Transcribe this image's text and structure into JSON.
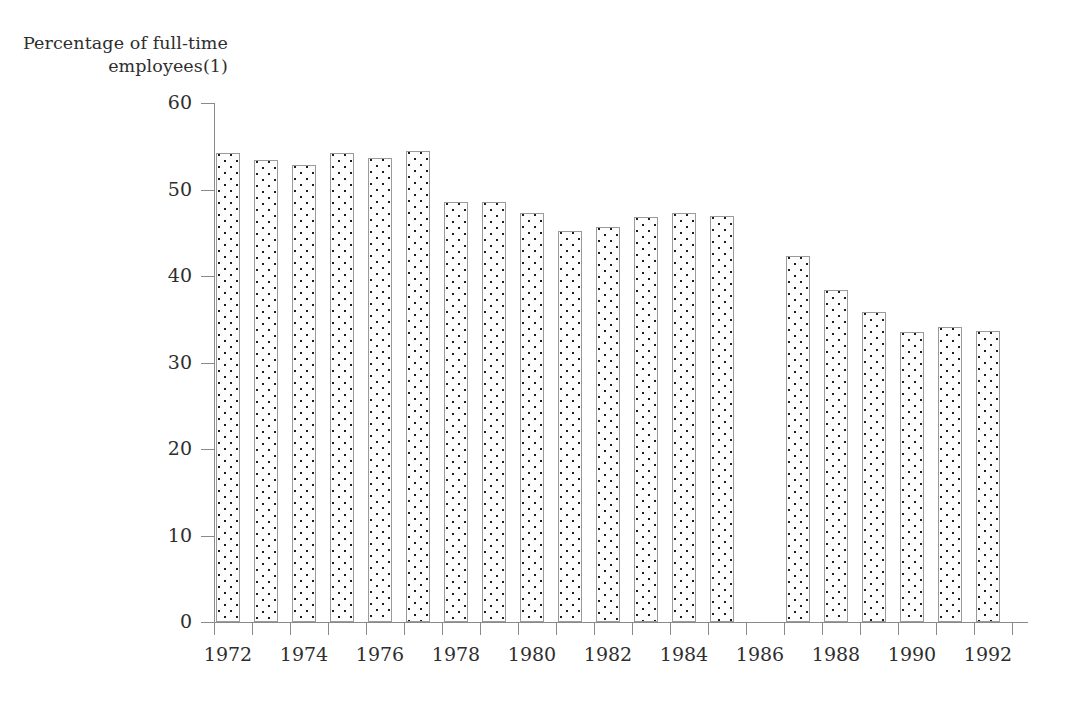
{
  "chart_data": {
    "type": "bar",
    "title": "Percentage of full-time employees(1)",
    "title_lines": [
      "Percentage of full-time",
      "employees(1)"
    ],
    "xlabel": "",
    "ylabel": "Percentage of full-time employees(1)",
    "ylim": [
      0,
      60
    ],
    "ytick_values": [
      0,
      10,
      20,
      30,
      40,
      50,
      60
    ],
    "ytick_labels": [
      "0",
      "10",
      "20",
      "30",
      "40",
      "50",
      "60"
    ],
    "grid": false,
    "legend": false,
    "categories": [
      "1972",
      "1973",
      "1974",
      "1975",
      "1976",
      "1977",
      "1978",
      "1979",
      "1980",
      "1981",
      "1982",
      "1983",
      "1984",
      "1985",
      "1986",
      "1987",
      "1988",
      "1989",
      "1990",
      "1991",
      "1992"
    ],
    "xtick_labels": [
      "1972",
      "",
      "1974",
      "",
      "1976",
      "",
      "1978",
      "",
      "1980",
      "",
      "1982",
      "",
      "1984",
      "",
      "1986",
      "",
      "1988",
      "",
      "1990",
      "",
      "1992"
    ],
    "values": [
      54.2,
      53.4,
      52.8,
      54.2,
      53.7,
      54.5,
      48.6,
      48.5,
      47.3,
      45.2,
      45.7,
      46.8,
      47.3,
      46.9,
      null,
      42.3,
      38.4,
      35.8,
      33.5,
      34.1,
      33.6
    ],
    "missing_categories": [
      "1986"
    ]
  },
  "style": {
    "bar_fill": "#fdfdfd",
    "bar_dot_color": "#1c1c1c",
    "bar_border": "#9a9a9a",
    "axis_color": "#8a8a8a",
    "text_color": "#2e2e2e",
    "background": "#ffffff"
  }
}
